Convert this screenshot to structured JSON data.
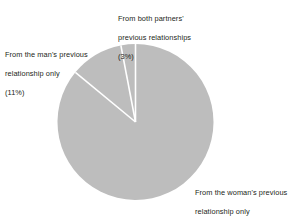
{
  "chart_data": {
    "type": "pie",
    "title": "",
    "subtitle": "",
    "xlabel": "",
    "ylabel": "",
    "legend_position": "none",
    "grid": false,
    "unit": "%",
    "start_angle_deg": 0,
    "direction": "clockwise",
    "categories": [
      "From the woman's previous relationship only",
      "From the man's previous relationship only",
      "From both partners' previous relationships"
    ],
    "values": [
      86,
      11,
      3
    ],
    "slices": [
      {
        "key": "woman",
        "label": "From the woman's previous relationship only",
        "label_line1": "From the woman's previous",
        "label_line2": "relationship only",
        "value": 86,
        "value_text": "(86%)",
        "color": "#bdbdbd",
        "start_deg": 0,
        "end_deg": 309.6
      },
      {
        "key": "man",
        "label": "From the man's previous relationship only",
        "label_line1": "From the man's previous",
        "label_line2": "relationship only",
        "value": 11,
        "value_text": "(11%)",
        "color": "#bdbdbd",
        "start_deg": 309.6,
        "end_deg": 349.2
      },
      {
        "key": "both",
        "label": "From both partners' previous relationships",
        "label_line1": "From both partners'",
        "label_line2": "previous relationships",
        "value": 3,
        "value_text": "(3%)",
        "color": "#bdbdbd",
        "start_deg": 349.2,
        "end_deg": 360
      }
    ],
    "geometry": {
      "center_x": 135.5,
      "center_y": 122,
      "radius": 78,
      "separator_color": "#ffffff",
      "separator_width": 1.6
    },
    "colors": {
      "background": "#ffffff",
      "slice_fill": "#bdbdbd",
      "separator": "#ffffff",
      "text": "#231f20"
    }
  },
  "labels": {
    "both": {
      "line1": "From both partners'",
      "line2": "previous relationships",
      "line3": "(3%)"
    },
    "man": {
      "line1": "From the man's previous",
      "line2": "relationship only",
      "line3": "(11%)"
    },
    "woman": {
      "line1": "From the woman's previous",
      "line2": "relationship only",
      "line3": "(86%)"
    }
  }
}
